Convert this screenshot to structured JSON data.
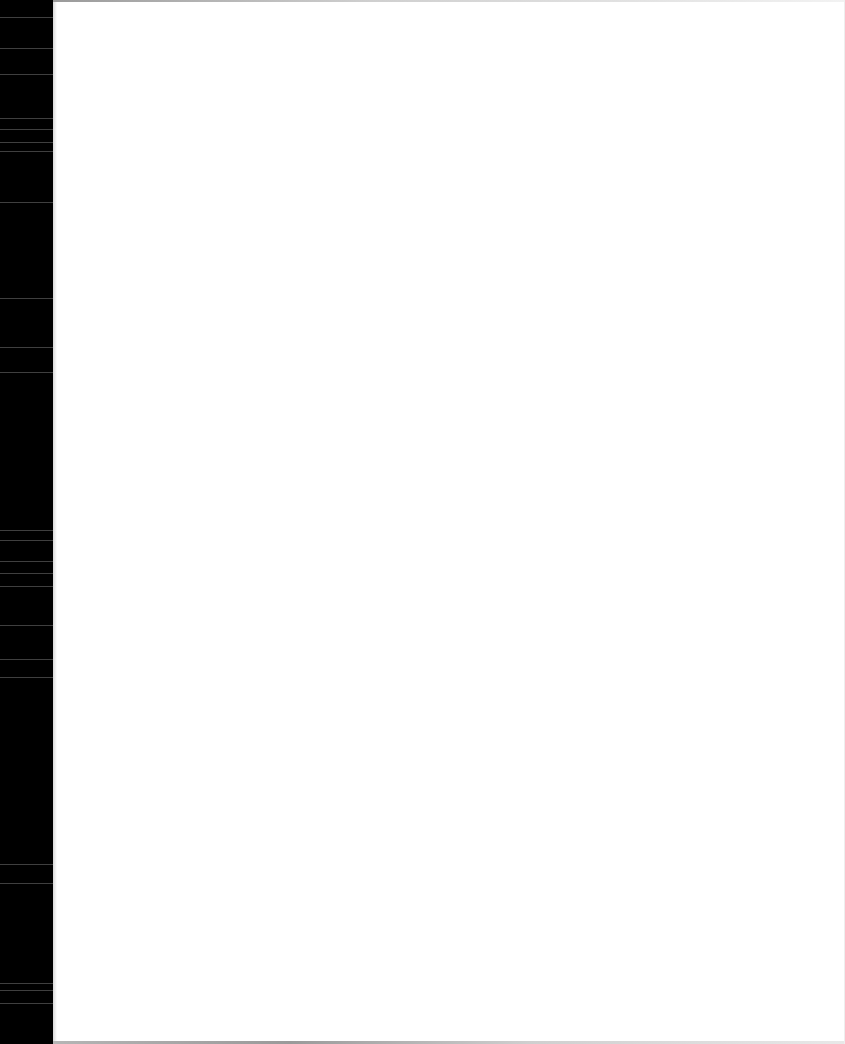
{
  "document": {
    "type": "blank scanned page",
    "text": "",
    "colors": {
      "page_background": "#ffffff",
      "scanner_edge": "#000000",
      "scan_streak": "#5a5a5a"
    }
  }
}
